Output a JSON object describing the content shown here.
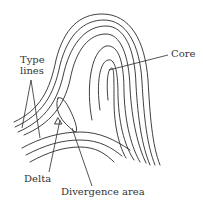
{
  "diagram": {
    "labels": {
      "type_lines_line1": "Type",
      "type_lines_line2": "lines",
      "core": "Core",
      "delta": "Delta",
      "divergence": "Divergence area"
    },
    "colors": {
      "stroke": "#2a2a2a",
      "text": "#333333",
      "background": "#ffffff"
    }
  }
}
